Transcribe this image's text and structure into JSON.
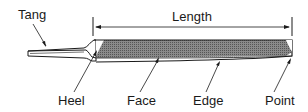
{
  "diagram": {
    "labels": {
      "tang": "Tang",
      "length": "Length",
      "heel": "Heel",
      "face": "Face",
      "edge": "Edge",
      "point": "Point"
    },
    "colors": {
      "line": "#1a1a1a",
      "face_fill": "#7a7a7a",
      "background": "#ffffff"
    }
  }
}
